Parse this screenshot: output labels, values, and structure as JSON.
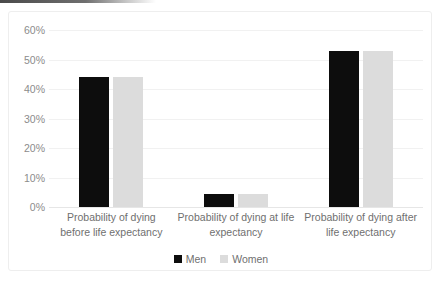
{
  "chart_data": {
    "type": "bar",
    "title": "",
    "subtitle": "",
    "xlabel": "",
    "ylabel": "",
    "ylim": [
      0,
      60
    ],
    "ytick_labels": [
      "0%",
      "10%",
      "20%",
      "30%",
      "40%",
      "50%",
      "60%"
    ],
    "ytick_values": [
      0,
      10,
      20,
      30,
      40,
      50,
      60
    ],
    "grid": true,
    "grid_axis": "y",
    "legend_position": "bottom",
    "categories": [
      "Probability of dying before life expectancy",
      "Probability of dying at life expectancy",
      "Probability of dying after life expectancy"
    ],
    "series": [
      {
        "name": "Men",
        "color": "#0d0d0d",
        "values": [
          44,
          4.5,
          53
        ]
      },
      {
        "name": "Women",
        "color": "#dcdcdc",
        "values": [
          44,
          4.5,
          53
        ]
      }
    ]
  },
  "legend": {
    "items": [
      {
        "label": "Men",
        "color": "#0d0d0d"
      },
      {
        "label": "Women",
        "color": "#dcdcdc"
      }
    ]
  },
  "axis": {
    "y_ticks": [
      {
        "label": "60%",
        "value": 60
      },
      {
        "label": "50%",
        "value": 50
      },
      {
        "label": "40%",
        "value": 40
      },
      {
        "label": "30%",
        "value": 30
      },
      {
        "label": "20%",
        "value": 20
      },
      {
        "label": "10%",
        "value": 10
      },
      {
        "label": "0%",
        "value": 0
      }
    ]
  },
  "categories": [
    {
      "line1": "Probability of dying",
      "line2": "before life expectancy"
    },
    {
      "line1": "Probability of dying at life",
      "line2": "expectancy"
    },
    {
      "line1": "Probability of dying after",
      "line2": "life expectancy"
    }
  ]
}
